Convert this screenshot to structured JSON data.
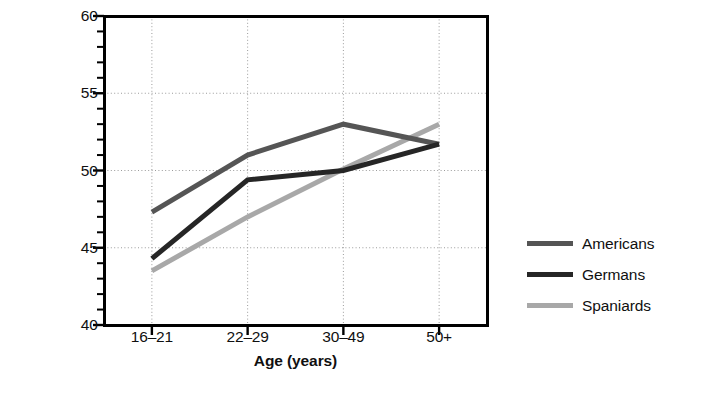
{
  "chart_data": {
    "type": "line",
    "title": "",
    "xlabel": "Age (years)",
    "ylabel": "Conscientiousness score",
    "categories": [
      "16–21",
      "22–29",
      "30–49",
      "50+"
    ],
    "ylim": [
      40,
      60
    ],
    "ytick_labels": [
      "40",
      "45",
      "50",
      "55",
      "60"
    ],
    "ytick_values": [
      40,
      45,
      50,
      55,
      60
    ],
    "yminor_step": 1,
    "grid": "dotted major gridlines, horizontal and vertical",
    "legend_position": "right",
    "series": [
      {
        "name": "Americans",
        "color": "#555555",
        "values": [
          47.3,
          51.0,
          53.0,
          51.7
        ]
      },
      {
        "name": "Germans",
        "color": "#262626",
        "values": [
          44.3,
          49.4,
          50.0,
          51.7
        ]
      },
      {
        "name": "Spaniards",
        "color": "#a8a8a8",
        "values": [
          43.5,
          47.0,
          50.1,
          53.0
        ]
      }
    ]
  },
  "axes": {
    "y_title": "Conscientiousness score",
    "x_title": "Age (years)"
  },
  "legend": {
    "entries": [
      {
        "label": "Americans",
        "color": "#555555"
      },
      {
        "label": "Germans",
        "color": "#262626"
      },
      {
        "label": "Spaniards",
        "color": "#a8a8a8"
      }
    ]
  },
  "colors": {
    "frame": "#000000",
    "grid": "#9b9b9b",
    "text": "#101010",
    "background": "#ffffff"
  }
}
